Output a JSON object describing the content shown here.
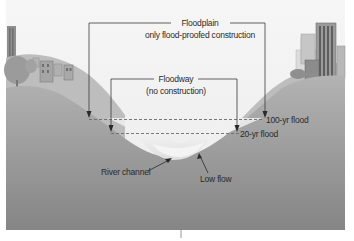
{
  "diagram": {
    "type": "cross-section",
    "colors": {
      "sky": "#f2f2f2",
      "hill_far": "#c4c4c4",
      "hill_near": "#a9a9a9",
      "ground_dark": "#8d8d8d",
      "water_light": "#ececec",
      "line": "#3a3a3a",
      "dash": "#6a6a6a",
      "text": "#2a2a2a"
    },
    "labels": {
      "floodplain": "Floodplain",
      "floodplain_note": "only flood-proofed construction",
      "floodway": "Floodway",
      "floodway_note": "(no construction)",
      "flood_100yr": "100-yr flood",
      "flood_20yr": "20-yr flood",
      "river_channel": "River channel",
      "low_flow": "Low flow"
    },
    "features": [
      "city-buildings-left",
      "houses-left",
      "tree-left",
      "city-skyscrapers-right",
      "floodplain-bracket",
      "floodway-bracket",
      "100yr-flood-line",
      "20yr-flood-line",
      "river-channel",
      "low-flow-water"
    ]
  }
}
